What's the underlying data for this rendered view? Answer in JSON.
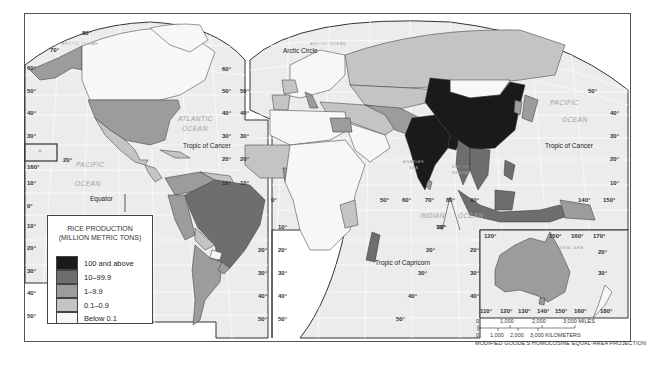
{
  "map": {
    "title": "Rice Production",
    "projection": "MODIFIED GOODE'S HOMOLOSINE EQUAL-AREA PROJECTION",
    "legend": {
      "title_line1": "RICE PRODUCTION",
      "title_line2": "(MILLION METRIC TONS)",
      "items": [
        {
          "label": "100 and above",
          "color": "#1a1a1a"
        },
        {
          "label": "10–99.9",
          "color": "#6e6e6e"
        },
        {
          "label": "1–9.9",
          "color": "#9c9c9c"
        },
        {
          "label": "0.1–0.9",
          "color": "#c4c4c4"
        },
        {
          "label": "Below 0.1",
          "color": "#f7f7f7"
        }
      ]
    },
    "scale_bar": {
      "miles_labels": [
        "0",
        "1,000",
        "2,000",
        "3,000 MILES"
      ],
      "km_labels": [
        "0",
        "1,000",
        "2,000",
        "3,000 KILOMETERS"
      ]
    },
    "lines": {
      "arctic_circle": "Arctic Circle",
      "tropic_cancer_west": "Tropic of Cancer",
      "tropic_cancer_east": "Tropic of Cancer",
      "equator": "Equator",
      "tropic_capricorn": "Tropic of Capricorn"
    },
    "oceans": {
      "arctic_west": "ARCTIC OCEAN",
      "arctic_east": "ARCTIC OCEAN",
      "atlantic_1": "ATLANTIC",
      "atlantic_2": "OCEAN",
      "pacific_west_1": "PACIFIC",
      "pacific_west_2": "OCEAN",
      "pacific_east_1": "PACIFIC",
      "pacific_east_2": "OCEAN",
      "indian_1": "INDIAN",
      "indian_2": "OCEAN",
      "arabian_sea_1": "ARABIAN",
      "arabian_sea_2": "SEA",
      "bay_bengal_1": "BAY OF",
      "bay_bengal_2": "BENGAL",
      "coral_sea": "CORAL SEA"
    },
    "degree_labels": {
      "left_lat": [
        "60°",
        "50°",
        "40°",
        "30°",
        "10°",
        "0°",
        "10°",
        "20°",
        "30°",
        "40°",
        "50°"
      ],
      "americas_right_lat": [
        "60°",
        "50°",
        "40°",
        "30°",
        "20°",
        "10°"
      ],
      "sa_right_lat": [
        "20°",
        "30°",
        "40°",
        "50°"
      ],
      "eurasia_left_lat": [
        "50°",
        "40°",
        "30°",
        "20°",
        "10°",
        "0°"
      ],
      "africa_left_lat": [
        "10°",
        "20°",
        "30°",
        "40°",
        "50°"
      ],
      "africa_right_lat": [
        "10°",
        "20°",
        "30°",
        "40°",
        "50°"
      ],
      "asia_right_lat": [
        "50°",
        "40°",
        "30°",
        "20°",
        "10°"
      ],
      "top": [
        "80°",
        "70°"
      ],
      "hawaii_lon": "160°",
      "hawaii_lat": "20°",
      "asia_lon": [
        "50°",
        "60°",
        "70°",
        "80°",
        "90°",
        "140°",
        "150°"
      ],
      "indian_lat": "10°",
      "aus_top_lon": [
        "120°",
        "150°",
        "160°",
        "170°"
      ],
      "aus_bottom_lon": [
        "110°",
        "120°",
        "130°",
        "140°",
        "150°",
        "160°",
        "180°"
      ],
      "aus_left_lat": [
        "20°",
        "30°",
        "40°"
      ],
      "aus_right_lat": [
        "20°",
        "30°"
      ]
    },
    "colors": {
      "ocean": "#ececec",
      "graticule": "#ffffff",
      "border": "#333333"
    }
  }
}
